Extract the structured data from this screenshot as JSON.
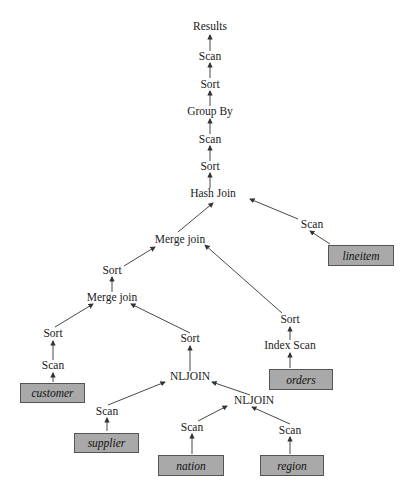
{
  "diagram": {
    "type": "query-execution-plan-tree",
    "operators": {
      "results": "Results",
      "scan_top": "Scan",
      "sort_top": "Sort",
      "group_by": "Group By",
      "scan_2": "Scan",
      "sort_2": "Sort",
      "hash_join": "Hash Join",
      "scan_lineitem": "Scan",
      "merge_join_upper": "Merge join",
      "sort_left": "Sort",
      "merge_join_lower": "Merge join",
      "sort_orders": "Sort",
      "index_scan": "Index Scan",
      "sort_customer": "Sort",
      "scan_customer": "Scan",
      "sort_nljoin": "Sort",
      "nljoin_outer": "NLJOIN",
      "scan_supplier": "Scan",
      "nljoin_inner": "NLJOIN",
      "scan_nation": "Scan",
      "scan_region": "Scan"
    },
    "tables": {
      "lineitem": "lineitem",
      "orders": "orders",
      "customer": "customer",
      "supplier": "supplier",
      "nation": "nation",
      "region": "region"
    },
    "edges": [
      [
        "scan_top",
        "results"
      ],
      [
        "sort_top",
        "scan_top"
      ],
      [
        "group_by",
        "sort_top"
      ],
      [
        "scan_2",
        "group_by"
      ],
      [
        "sort_2",
        "scan_2"
      ],
      [
        "hash_join",
        "sort_2"
      ],
      [
        "merge_join_upper",
        "hash_join"
      ],
      [
        "scan_lineitem",
        "hash_join"
      ],
      [
        "lineitem",
        "scan_lineitem"
      ],
      [
        "sort_left",
        "merge_join_upper"
      ],
      [
        "sort_orders",
        "merge_join_upper"
      ],
      [
        "merge_join_lower",
        "sort_left"
      ],
      [
        "index_scan",
        "sort_orders"
      ],
      [
        "orders",
        "index_scan"
      ],
      [
        "sort_customer",
        "merge_join_lower"
      ],
      [
        "sort_nljoin",
        "merge_join_lower"
      ],
      [
        "scan_customer",
        "sort_customer"
      ],
      [
        "customer",
        "scan_customer"
      ],
      [
        "nljoin_outer",
        "sort_nljoin"
      ],
      [
        "scan_supplier",
        "nljoin_outer"
      ],
      [
        "nljoin_inner",
        "nljoin_outer"
      ],
      [
        "supplier",
        "scan_supplier"
      ],
      [
        "scan_nation",
        "nljoin_inner"
      ],
      [
        "scan_region",
        "nljoin_inner"
      ],
      [
        "nation",
        "scan_nation"
      ],
      [
        "region",
        "scan_region"
      ]
    ],
    "colors": {
      "table_fill": "#a9a9a9",
      "table_border": "#555555",
      "edge": "#333333",
      "text": "#1a1a1a"
    }
  }
}
